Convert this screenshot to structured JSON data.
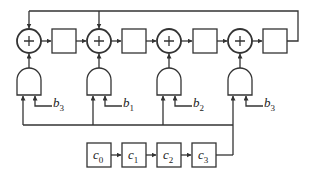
{
  "diagram": {
    "adders": [
      {
        "symbol": "+"
      },
      {
        "symbol": "+"
      },
      {
        "symbol": "+"
      },
      {
        "symbol": "+"
      }
    ],
    "and_gate_inputs": [
      {
        "label": "b",
        "sub": "3"
      },
      {
        "label": "b",
        "sub": "1"
      },
      {
        "label": "b",
        "sub": "2"
      },
      {
        "label": "b",
        "sub": "3"
      }
    ],
    "shift_register": [
      {
        "label": "c",
        "sub": "0"
      },
      {
        "label": "c",
        "sub": "1"
      },
      {
        "label": "c",
        "sub": "2"
      },
      {
        "label": "c",
        "sub": "3"
      }
    ],
    "colors": {
      "stroke": "#333333",
      "background": "#ffffff"
    }
  }
}
